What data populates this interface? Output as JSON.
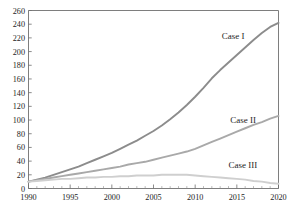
{
  "chart_data": {
    "type": "line",
    "title": "",
    "xlabel": "",
    "ylabel": "",
    "xlim": [
      1990,
      2020
    ],
    "ylim": [
      0,
      260
    ],
    "ytick_step": 20,
    "xtick_step": 5,
    "grid": false,
    "legend_position": "inline-right",
    "x": [
      1990,
      1991,
      1992,
      1993,
      1994,
      1995,
      1996,
      1997,
      1998,
      1999,
      2000,
      2001,
      2002,
      2003,
      2004,
      2005,
      2006,
      2007,
      2008,
      2009,
      2010,
      2011,
      2012,
      2013,
      2014,
      2015,
      2016,
      2017,
      2018,
      2019,
      2020
    ],
    "yticks": [
      "0",
      "20",
      "40",
      "60",
      "80",
      "100",
      "120",
      "140",
      "160",
      "180",
      "200",
      "220",
      "240",
      "260"
    ],
    "xticks": [
      "1990",
      "1995",
      "2000",
      "2005",
      "2010",
      "2015",
      "2020"
    ],
    "series": [
      {
        "name": "Case I",
        "color": "#8c8c8c",
        "values": [
          10,
          13,
          16,
          20,
          24,
          28,
          32,
          37,
          42,
          47,
          52,
          58,
          64,
          70,
          77,
          84,
          92,
          101,
          111,
          122,
          134,
          147,
          161,
          173,
          184,
          195,
          206,
          217,
          227,
          236,
          242
        ]
      },
      {
        "name": "Case II",
        "color": "#a9a9a9",
        "values": [
          10,
          12,
          14,
          16,
          18,
          20,
          22,
          24,
          26,
          28,
          30,
          32,
          35,
          37,
          39,
          42,
          45,
          48,
          51,
          54,
          58,
          63,
          68,
          73,
          78,
          83,
          88,
          93,
          97,
          102,
          106
        ]
      },
      {
        "name": "Case III",
        "color": "#cfcfcf",
        "values": [
          10,
          11,
          12,
          13,
          14,
          14,
          15,
          16,
          16,
          17,
          17,
          18,
          18,
          19,
          19,
          19,
          20,
          20,
          20,
          20,
          19,
          18,
          17,
          16,
          15,
          14,
          13,
          11,
          10,
          8,
          7
        ]
      }
    ],
    "annotations": [
      {
        "text": "Case I",
        "x": 2013.2,
        "y": 218
      },
      {
        "text": "Case II",
        "x": 2014.2,
        "y": 96
      },
      {
        "text": "Case III",
        "x": 2014.0,
        "y": 30
      }
    ],
    "title_fragment": "​"
  }
}
